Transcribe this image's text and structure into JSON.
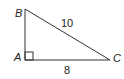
{
  "diagram": {
    "type": "right-triangle",
    "vertices": {
      "A": {
        "label": "A",
        "x": 25,
        "y": 60,
        "right_angle": true
      },
      "B": {
        "label": "B",
        "x": 25,
        "y": 9
      },
      "C": {
        "label": "C",
        "x": 110,
        "y": 60
      }
    },
    "sides": {
      "BC": {
        "label": "10"
      },
      "AC": {
        "label": "8"
      },
      "AB": {
        "label": ""
      }
    },
    "stroke_color": "#333333"
  }
}
